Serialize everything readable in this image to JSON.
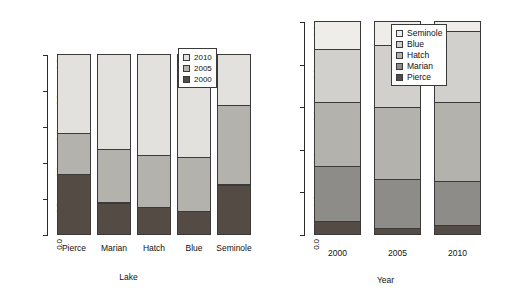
{
  "chart_data": [
    {
      "type": "bar",
      "id": "lake-panel",
      "stacked": true,
      "normalized": true,
      "title": "",
      "xlabel": "Lake",
      "ylabel": "",
      "ylim": [
        0.0,
        1.0
      ],
      "ytick_labels": [
        "0.0",
        "0.2",
        "0.4",
        "0.6",
        "0.8",
        "1.0"
      ],
      "ytick_values": [
        0.0,
        0.2,
        0.4,
        0.6,
        0.8,
        1.0
      ],
      "grid": false,
      "categories": [
        "Pierce",
        "Marian",
        "Hatch",
        "Blue",
        "Seminole"
      ],
      "legend_position": "top-right",
      "series": [
        {
          "name": "2000",
          "color": "#554b45",
          "values": [
            0.335,
            0.175,
            0.15,
            0.13,
            0.275
          ]
        },
        {
          "name": "2005",
          "color": "#b4b2ad",
          "values": [
            0.225,
            0.295,
            0.29,
            0.3,
            0.44
          ]
        },
        {
          "name": "2010",
          "color": "#e2e1dd",
          "values": [
            0.44,
            0.53,
            0.56,
            0.57,
            0.285
          ]
        }
      ],
      "stack_order_bottom_to_top": [
        "2000",
        "2005",
        "2010"
      ],
      "legend_entries": [
        "2010",
        "2005",
        "2000"
      ]
    },
    {
      "type": "bar",
      "id": "year-panel",
      "stacked": true,
      "normalized": true,
      "title": "",
      "xlabel": "Year",
      "ylabel": "",
      "ylim": [
        0.0,
        1.0
      ],
      "ytick_labels": [
        "0.0",
        "0.2",
        "0.4",
        "0.6",
        "0.8",
        "1.0"
      ],
      "ytick_values": [
        0.0,
        0.2,
        0.4,
        0.6,
        0.8,
        1.0
      ],
      "grid": false,
      "categories": [
        "2000",
        "2005",
        "2010"
      ],
      "legend_position": "top-right",
      "series": [
        {
          "name": "Pierce",
          "color": "#554b45",
          "values": [
            0.06,
            0.03,
            0.04
          ]
        },
        {
          "name": "Marian",
          "color": "#8e8c88",
          "values": [
            0.26,
            0.23,
            0.21
          ]
        },
        {
          "name": "Hatch",
          "color": "#b4b2ad",
          "values": [
            0.3,
            0.335,
            0.37
          ]
        },
        {
          "name": "Blue",
          "color": "#d2d0cc",
          "values": [
            0.25,
            0.29,
            0.335
          ]
        },
        {
          "name": "Seminole",
          "color": "#eeedea",
          "values": [
            0.13,
            0.115,
            0.045
          ]
        }
      ],
      "stack_order_bottom_to_top": [
        "Pierce",
        "Marian",
        "Hatch",
        "Blue",
        "Seminole"
      ],
      "legend_entries": [
        "Seminole",
        "Blue",
        "Hatch",
        "Marian",
        "Pierce"
      ]
    }
  ]
}
